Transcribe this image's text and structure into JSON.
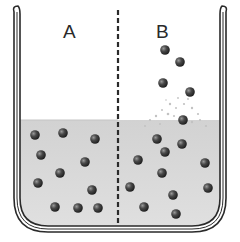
{
  "diagram": {
    "type": "beaker-evaporation-comparison",
    "labels": {
      "left": "A",
      "right": "B"
    },
    "colors": {
      "outline": "#2a2a2a",
      "liquid": "#d6d6d6",
      "particle": "#3a3a3a",
      "particle_highlight": "#8a8a8a",
      "vapor_speckle": "#bdbdbd",
      "background": "#ffffff"
    },
    "liquid_level_y": 120,
    "divider": {
      "style": "dashed",
      "x": 118
    },
    "particles": {
      "A_liquid": [
        [
          35,
          135
        ],
        [
          63,
          133
        ],
        [
          95,
          139
        ],
        [
          41,
          155
        ],
        [
          85,
          162
        ],
        [
          60,
          173
        ],
        [
          38,
          183
        ],
        [
          92,
          190
        ],
        [
          55,
          207
        ],
        [
          78,
          208
        ],
        [
          98,
          208
        ]
      ],
      "B_vapor": [
        [
          165,
          50
        ],
        [
          180,
          62
        ],
        [
          163,
          83
        ],
        [
          190,
          92
        ],
        [
          183,
          120
        ]
      ],
      "B_liquid": [
        [
          157,
          139
        ],
        [
          182,
          144
        ],
        [
          165,
          152
        ],
        [
          138,
          160
        ],
        [
          205,
          163
        ],
        [
          162,
          173
        ],
        [
          130,
          187
        ],
        [
          208,
          188
        ],
        [
          173,
          195
        ],
        [
          144,
          207
        ],
        [
          176,
          214
        ]
      ]
    }
  }
}
